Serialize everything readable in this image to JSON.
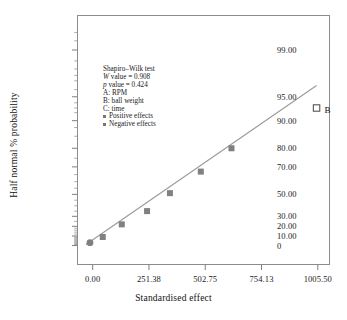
{
  "chart_data": {
    "type": "scatter",
    "title": "",
    "xlabel": "Standardised effect",
    "ylabel": "Half normal % probability",
    "xlim": [
      -70,
      1060
    ],
    "ylim": [
      0,
      99
    ],
    "grid": false,
    "legend_position": "inside-upper-left",
    "xticks": [
      "0.00",
      "251.38",
      "502.75",
      "754.13",
      "1005.50"
    ],
    "xtick_values": [
      0,
      251.38,
      502.75,
      754.13,
      1005.5
    ],
    "yticks": [
      "99.00",
      "95.00",
      "90.00",
      "80.00",
      "70.00",
      "50.00",
      "30.00",
      "20.00",
      "10.00",
      "0"
    ],
    "ytick_values": [
      99,
      95,
      90,
      80,
      70,
      50,
      30,
      20,
      10,
      0
    ],
    "series": [
      {
        "name": "Negative effects",
        "marker": "filled-square",
        "color": "#808080",
        "points": [
          {
            "x": 45,
            "y": 9
          },
          {
            "x": 130,
            "y": 22
          },
          {
            "x": 243,
            "y": 35
          },
          {
            "x": 345,
            "y": 51
          },
          {
            "x": 483,
            "y": 67
          },
          {
            "x": 620,
            "y": 80
          }
        ]
      },
      {
        "name": "Positive effects",
        "marker": "filled-circle",
        "color": "#808080",
        "points": [
          {
            "x": -12,
            "y": 3
          }
        ]
      },
      {
        "name": "Labelled effect",
        "marker": "open-square",
        "color": "#555555",
        "points": [
          {
            "x": 1000,
            "y": 93,
            "label": "B"
          }
        ]
      }
    ],
    "reference_line": {
      "name": "half-normal reference line",
      "color": "#9a9a9a",
      "from": {
        "x": -30,
        "y": 1.2
      },
      "to": {
        "x": 1000,
        "y": 96.5
      }
    },
    "annotations": {
      "test_name": "Shapiro–Wilk test",
      "w_symbol": "W",
      "w_value": " value = 0.908",
      "p_symbol": "p",
      "p_value": " value = 0.424",
      "factors": [
        "A: RPM",
        "B: ball weight",
        "C: time"
      ],
      "legend": [
        "Positive effects",
        "Negative effects"
      ]
    }
  },
  "colors": {
    "marker": "#808080",
    "line": "#9a9a9a",
    "frame": "#8c8c8c",
    "text": "#1a1a1a"
  }
}
